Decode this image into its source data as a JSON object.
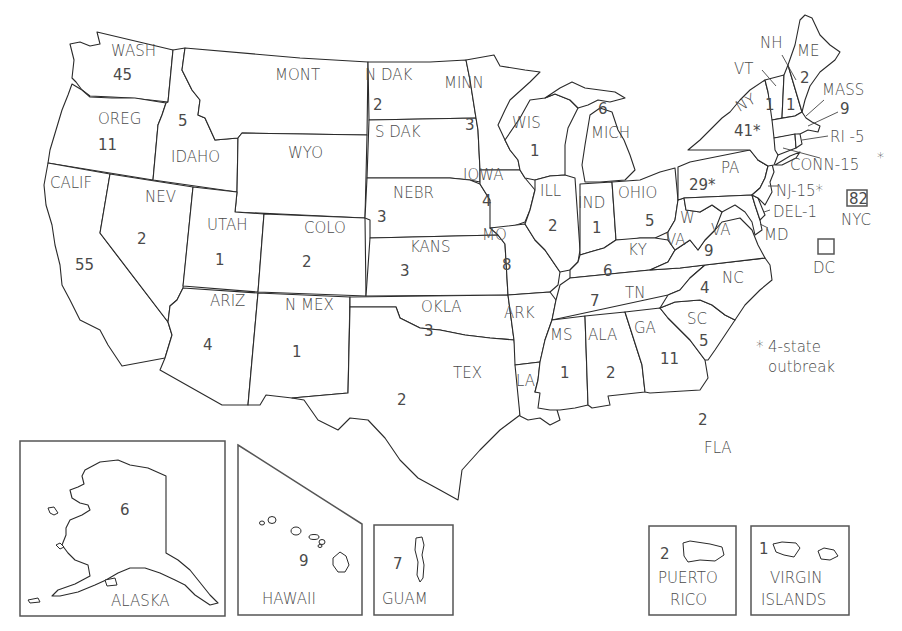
{
  "map": {
    "legend": {
      "symbol": "*",
      "line1": "4-state",
      "line2": "outbreak"
    },
    "states": [
      {
        "abbr": "WASH",
        "count": "45"
      },
      {
        "abbr": "OREG",
        "count": "11"
      },
      {
        "abbr": "CALIF",
        "count": "55"
      },
      {
        "abbr": "IDAHO",
        "count": "5"
      },
      {
        "abbr": "NEV",
        "count": "2"
      },
      {
        "abbr": "MONT",
        "count": ""
      },
      {
        "abbr": "WYO",
        "count": ""
      },
      {
        "abbr": "UTAH",
        "count": "1"
      },
      {
        "abbr": "COLO",
        "count": "2"
      },
      {
        "abbr": "ARIZ",
        "count": "4"
      },
      {
        "abbr": "N MEX",
        "count": "1"
      },
      {
        "abbr": "N DAK",
        "count": "2"
      },
      {
        "abbr": "S DAK",
        "count": ""
      },
      {
        "abbr": "NEBR",
        "count": "3"
      },
      {
        "abbr": "KANS",
        "count": "3"
      },
      {
        "abbr": "OKLA",
        "count": "3"
      },
      {
        "abbr": "TEX",
        "count": "2"
      },
      {
        "abbr": "MINN",
        "count": "3"
      },
      {
        "abbr": "IOWA",
        "count": "4"
      },
      {
        "abbr": "MO",
        "count": "8"
      },
      {
        "abbr": "ARK",
        "count": ""
      },
      {
        "abbr": "LA",
        "count": ""
      },
      {
        "abbr": "WIS",
        "count": "1"
      },
      {
        "abbr": "ILL",
        "count": "2"
      },
      {
        "abbr": "MICH",
        "count": "6"
      },
      {
        "abbr": "IND",
        "count": "1"
      },
      {
        "abbr": "OHIO",
        "count": "5"
      },
      {
        "abbr": "KY",
        "count": "6"
      },
      {
        "abbr": "TN",
        "count": "7"
      },
      {
        "abbr": "MS",
        "count": "1"
      },
      {
        "abbr": "ALA",
        "count": "2"
      },
      {
        "abbr": "GA",
        "count": "11"
      },
      {
        "abbr": "FLA",
        "count": "2"
      },
      {
        "abbr": "SC",
        "count": "5"
      },
      {
        "abbr": "NC",
        "count": "4"
      },
      {
        "abbr": "VA",
        "count": "9"
      },
      {
        "abbr": "W VA",
        "count": ""
      },
      {
        "abbr": "PA",
        "count": "29*"
      },
      {
        "abbr": "NY",
        "count": "41*"
      },
      {
        "abbr": "VT",
        "count": "1"
      },
      {
        "abbr": "NH",
        "count": "1"
      },
      {
        "abbr": "ME",
        "count": "2"
      },
      {
        "abbr": "MASS",
        "count": "9"
      },
      {
        "abbr": "RI",
        "count": "5",
        "label": "RI -5"
      },
      {
        "abbr": "CONN",
        "count": "15*",
        "label": "CONN-15",
        "star": "*"
      },
      {
        "abbr": "NJ",
        "count": "15*",
        "label": "NJ-15*"
      },
      {
        "abbr": "DEL",
        "count": "1",
        "label": "DEL-1"
      },
      {
        "abbr": "MD",
        "count": ""
      },
      {
        "abbr": "NYC",
        "count": "82"
      },
      {
        "abbr": "DC",
        "count": ""
      }
    ],
    "insets": {
      "alaska": {
        "label": "ALASKA",
        "count": "6"
      },
      "hawaii": {
        "label": "HAWAII",
        "count": "9"
      },
      "guam": {
        "label": "GUAM",
        "count": "7"
      },
      "puerto_rico": {
        "label1": "PUERTO",
        "label2": "RICO",
        "count": "2"
      },
      "virgin_islands": {
        "label1": "VIRGIN",
        "label2": "ISLANDS",
        "count": "1"
      }
    }
  }
}
